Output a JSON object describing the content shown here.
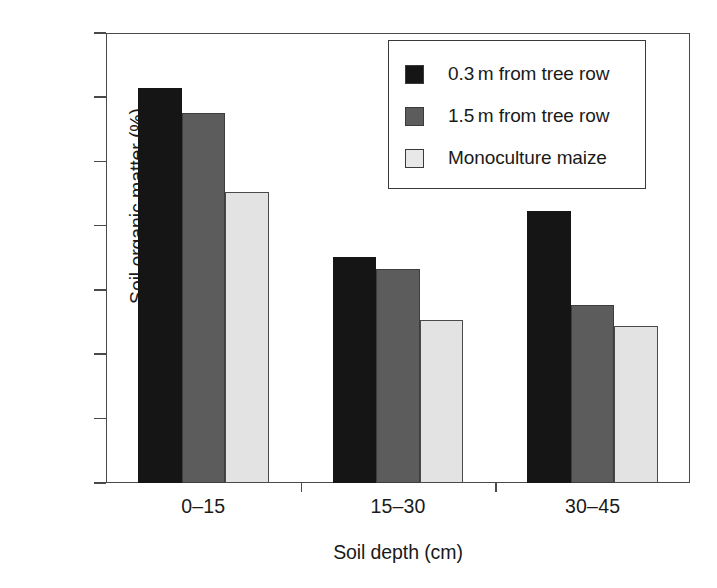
{
  "chart_data": {
    "type": "bar",
    "title": "",
    "subtitle": "",
    "xlabel": "Soil depth (cm)",
    "ylabel": "Soil organic matter (%)",
    "categories": [
      "0–15",
      "15–30",
      "30–45"
    ],
    "series": [
      {
        "name": "0.3 m from tree row",
        "color": "#151515",
        "values": [
          2.414,
          2.152,
          2.223
        ]
      },
      {
        "name": "1.5 m from tree row",
        "color": "#5c5c5c",
        "values": [
          2.375,
          2.133,
          2.077
        ]
      },
      {
        "name": "Monoculture maize",
        "color": "#e3e3e3",
        "values": [
          2.253,
          2.053,
          2.044
        ]
      }
    ],
    "ylim": [
      1.8,
      2.5
    ],
    "yticks": [
      "1.8",
      "1.9",
      "2.0",
      "2.1",
      "2.2",
      "2.3",
      "2.4",
      "2.5"
    ],
    "ytick_values": [
      1.8,
      1.9,
      2.0,
      2.1,
      2.2,
      2.3,
      2.4,
      2.5
    ],
    "grid": false,
    "legend_position": "top-right",
    "legend_entries": [
      "0.3 m from tree row",
      "1.5 m from tree row",
      "Monoculture maize"
    ]
  }
}
